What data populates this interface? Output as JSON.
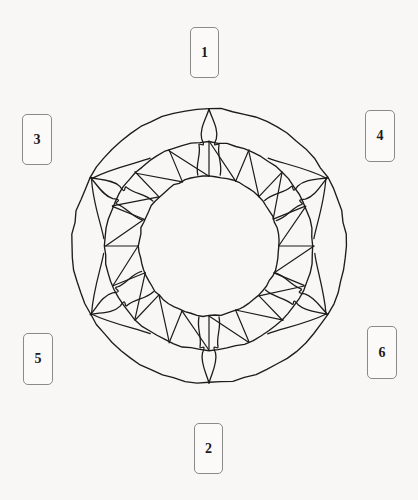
{
  "page": {
    "background_color": "#f8f7f5",
    "width": 418,
    "height": 500
  },
  "diagram": {
    "name": "sun-wheel-mandala",
    "stroke_color": "#1c1c1c",
    "fill_color": "none",
    "center": {
      "x": 209,
      "y": 246
    },
    "radii": {
      "outer": 137,
      "middle": 104,
      "inner": 70
    },
    "sawtooth_teeth": 16,
    "flame_rays": 6,
    "flame_ray_angles_deg": [
      90,
      150,
      210,
      270,
      330,
      30
    ]
  },
  "callouts": [
    {
      "id": "callout-1",
      "label": "1",
      "x": 190,
      "y": 27,
      "w": 29,
      "h": 51
    },
    {
      "id": "callout-3",
      "label": "3",
      "x": 22,
      "y": 114,
      "w": 30,
      "h": 51
    },
    {
      "id": "callout-4",
      "label": "4",
      "x": 365,
      "y": 110,
      "w": 30,
      "h": 52
    },
    {
      "id": "callout-5",
      "label": "5",
      "x": 23,
      "y": 333,
      "w": 30,
      "h": 52
    },
    {
      "id": "callout-6",
      "label": "6",
      "x": 367,
      "y": 326,
      "w": 30,
      "h": 53
    },
    {
      "id": "callout-2",
      "label": "2",
      "x": 194,
      "y": 423,
      "w": 29,
      "h": 51
    }
  ],
  "callout_style": {
    "fill": "#fbfaf8",
    "border_color": "#8a8a8a",
    "text_color": "#1b1b1b"
  }
}
